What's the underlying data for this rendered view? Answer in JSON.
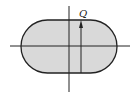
{
  "diagram": {
    "shape": "stadium",
    "fill_color": "#d9d9d9",
    "stroke_color": "#222222",
    "label_Q": "Q"
  }
}
